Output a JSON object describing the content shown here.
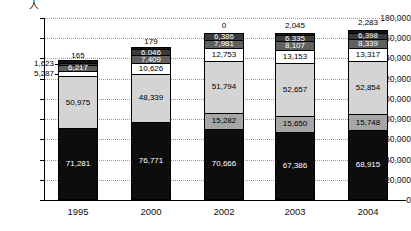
{
  "unit": "人",
  "yaxis": {
    "min": 0,
    "max": 180000,
    "step": 20000,
    "ticks": [
      "180,000",
      "160,000",
      "140,000",
      "120,000",
      "100,000",
      "80,000",
      "60,000",
      "40,000",
      "20,000",
      "0"
    ]
  },
  "chart_data": {
    "type": "bar",
    "title": "",
    "xlabel": "",
    "ylabel": "人",
    "ylim": [
      0,
      180000
    ],
    "grid": true,
    "stacked": true,
    "legend": "none",
    "categories": [
      "1995",
      "2000",
      "2002",
      "2003",
      "2004"
    ],
    "series": [
      {
        "name": "segment-1",
        "order": 1,
        "color": "#0d0d0d",
        "values": [
          71281,
          76771,
          70666,
          67386,
          68915
        ]
      },
      {
        "name": "segment-2",
        "order": 2,
        "color": "#a6a6a6",
        "values": [
          null,
          null,
          15282,
          15650,
          15748
        ]
      },
      {
        "name": "segment-3",
        "order": 3,
        "color": "#d4d4d4",
        "values": [
          50975,
          48339,
          51794,
          52657,
          52854
        ]
      },
      {
        "name": "segment-4",
        "order": 4,
        "color": "#ffffff",
        "values": [
          5287,
          10626,
          12753,
          13153,
          13317
        ]
      },
      {
        "name": "segment-5",
        "order": 5,
        "color": "#606060",
        "values": [
          6217,
          7409,
          7981,
          8107,
          8339
        ]
      },
      {
        "name": "segment-6",
        "order": 6,
        "color": "#3a3a3a",
        "values": [
          1623,
          6046,
          6386,
          6335,
          6398
        ]
      },
      {
        "name": "segment-7",
        "order": 7,
        "color": "#141414",
        "values": [
          165,
          179,
          0,
          2045,
          2283
        ]
      }
    ],
    "totals": [
      135548,
      149370,
      164862,
      165333,
      167854
    ]
  },
  "bars": [
    {
      "category": "1995",
      "top_label": "165",
      "segments": [
        {
          "name": "seg-1995-1",
          "value": 71281,
          "label": "71,281",
          "color": "black",
          "inside": true
        },
        {
          "name": "seg-1995-3",
          "value": 50975,
          "label": "50,975",
          "color": "light",
          "inside": true
        },
        {
          "name": "seg-1995-4",
          "value": 5287,
          "label": "5,287",
          "color": "white",
          "inside": false
        },
        {
          "name": "seg-1995-5",
          "value": 6217,
          "label": "6,217",
          "color": "dark",
          "inside": true
        },
        {
          "name": "seg-1995-6",
          "value": 1623,
          "label": "1,623",
          "color": "darker",
          "inside": false
        },
        {
          "name": "seg-1995-7",
          "value": 165,
          "label": "165",
          "color": "tiny",
          "inside": false
        }
      ]
    },
    {
      "category": "2000",
      "top_label": "179",
      "segments": [
        {
          "name": "seg-2000-1",
          "value": 76771,
          "label": "76,771",
          "color": "black",
          "inside": true
        },
        {
          "name": "seg-2000-3",
          "value": 48339,
          "label": "48,339",
          "color": "light",
          "inside": true
        },
        {
          "name": "seg-2000-4",
          "value": 10626,
          "label": "10,626",
          "color": "white",
          "inside": true
        },
        {
          "name": "seg-2000-5",
          "value": 7409,
          "label": "7,409",
          "color": "dark",
          "inside": true
        },
        {
          "name": "seg-2000-6",
          "value": 6046,
          "label": "6,046",
          "color": "darker",
          "inside": true
        },
        {
          "name": "seg-2000-7",
          "value": 179,
          "label": "179",
          "color": "tiny",
          "inside": false
        }
      ]
    },
    {
      "category": "2002",
      "top_label": "0",
      "segments": [
        {
          "name": "seg-2002-1",
          "value": 70666,
          "label": "70,666",
          "color": "black",
          "inside": true
        },
        {
          "name": "seg-2002-2",
          "value": 15282,
          "label": "15,282",
          "color": "mid",
          "inside": true
        },
        {
          "name": "seg-2002-3",
          "value": 51794,
          "label": "51,794",
          "color": "light",
          "inside": true
        },
        {
          "name": "seg-2002-4",
          "value": 12753,
          "label": "12,753",
          "color": "white",
          "inside": true
        },
        {
          "name": "seg-2002-5",
          "value": 7981,
          "label": "7,981",
          "color": "dark",
          "inside": true
        },
        {
          "name": "seg-2002-6",
          "value": 6386,
          "label": "6,386",
          "color": "darker",
          "inside": true
        },
        {
          "name": "seg-2002-7",
          "value": 0,
          "label": "0",
          "color": "tiny",
          "inside": false
        }
      ]
    },
    {
      "category": "2003",
      "top_label": "2,045",
      "segments": [
        {
          "name": "seg-2003-1",
          "value": 67386,
          "label": "67,386",
          "color": "black",
          "inside": true
        },
        {
          "name": "seg-2003-2",
          "value": 15650,
          "label": "15,650",
          "color": "mid",
          "inside": true
        },
        {
          "name": "seg-2003-3",
          "value": 52657,
          "label": "52,657",
          "color": "light",
          "inside": true
        },
        {
          "name": "seg-2003-4",
          "value": 13153,
          "label": "13,153",
          "color": "white",
          "inside": true
        },
        {
          "name": "seg-2003-5",
          "value": 8107,
          "label": "8,107",
          "color": "dark",
          "inside": true
        },
        {
          "name": "seg-2003-6",
          "value": 6335,
          "label": "6,335",
          "color": "darker",
          "inside": true
        },
        {
          "name": "seg-2003-7",
          "value": 2045,
          "label": "2,045",
          "color": "tiny",
          "inside": false
        }
      ]
    },
    {
      "category": "2004",
      "top_label": "2,283",
      "segments": [
        {
          "name": "seg-2004-1",
          "value": 68915,
          "label": "68,915",
          "color": "black",
          "inside": true
        },
        {
          "name": "seg-2004-2",
          "value": 15748,
          "label": "15,748",
          "color": "mid",
          "inside": true
        },
        {
          "name": "seg-2004-3",
          "value": 52854,
          "label": "52,854",
          "color": "light",
          "inside": true
        },
        {
          "name": "seg-2004-4",
          "value": 13317,
          "label": "13,317",
          "color": "white",
          "inside": true
        },
        {
          "name": "seg-2004-5",
          "value": 8339,
          "label": "8,339",
          "color": "dark",
          "inside": true
        },
        {
          "name": "seg-2004-6",
          "value": 6398,
          "label": "6,398",
          "color": "darker",
          "inside": true
        },
        {
          "name": "seg-2004-7",
          "value": 2283,
          "label": "2,283",
          "color": "tiny",
          "inside": false
        }
      ]
    }
  ]
}
